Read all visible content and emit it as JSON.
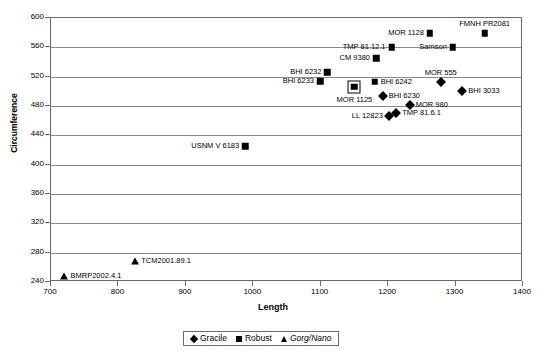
{
  "chart_data": {
    "type": "scatter",
    "title": "",
    "xlabel": "Length",
    "ylabel": "Circumference",
    "xlim": [
      700,
      1400
    ],
    "ylim": [
      240,
      600
    ],
    "xticks": [
      700,
      800,
      900,
      1000,
      1100,
      1200,
      1300,
      1400
    ],
    "yticks": [
      240,
      280,
      320,
      360,
      400,
      440,
      480,
      520,
      560,
      600
    ],
    "grid": "horizontal",
    "legend_position": "bottom-center",
    "series": [
      {
        "name": "Gracile",
        "marker": "diamond",
        "points": [
          {
            "label": "MOR 555",
            "x": 1278,
            "y": 513,
            "label_pos": "above"
          },
          {
            "label": "BHI 3033",
            "x": 1310,
            "y": 500,
            "label_pos": "right"
          },
          {
            "label": "BHI 6230",
            "x": 1192,
            "y": 493,
            "label_pos": "right"
          },
          {
            "label": "MOR 980",
            "x": 1232,
            "y": 481,
            "label_pos": "right"
          },
          {
            "label": "LL 12823",
            "x": 1201,
            "y": 467,
            "label_pos": "left"
          },
          {
            "label": "TMP 81.6.1",
            "x": 1212,
            "y": 470,
            "label_pos": "right"
          }
        ]
      },
      {
        "name": "Robust",
        "marker": "square",
        "points": [
          {
            "label": "FMNH PR2081",
            "x": 1343,
            "y": 579,
            "label_pos": "above"
          },
          {
            "label": "MOR 1128",
            "x": 1262,
            "y": 579,
            "label_pos": "left"
          },
          {
            "label": "Samson",
            "x": 1296,
            "y": 560,
            "label_pos": "left"
          },
          {
            "label": "TMP 81.12.1",
            "x": 1205,
            "y": 560,
            "label_pos": "left"
          },
          {
            "label": "CM 9380",
            "x": 1182,
            "y": 545,
            "label_pos": "left"
          },
          {
            "label": "BHI 6232",
            "x": 1110,
            "y": 526,
            "label_pos": "left"
          },
          {
            "label": "BHI 6233",
            "x": 1099,
            "y": 514,
            "label_pos": "left"
          },
          {
            "label": "BHI 6242",
            "x": 1180,
            "y": 513,
            "label_pos": "right"
          },
          {
            "label": "MOR 1125",
            "x": 1150,
            "y": 506,
            "label_pos": "below",
            "selected": true
          },
          {
            "label": "USNM V 6183",
            "x": 988,
            "y": 425,
            "label_pos": "left"
          }
        ]
      },
      {
        "name": "Gorg/Nano",
        "marker": "triangle",
        "italic": true,
        "points": [
          {
            "label": "TCM2001.89.1",
            "x": 825,
            "y": 269,
            "label_pos": "right"
          },
          {
            "label": "BMRP2002.4.1",
            "x": 720,
            "y": 248,
            "label_pos": "right"
          }
        ]
      }
    ]
  },
  "legend": {
    "items": [
      {
        "label": "Gracile",
        "marker": "diamond-marker",
        "italic": false
      },
      {
        "label": "Robust",
        "marker": "square-marker",
        "italic": false
      },
      {
        "label": "Gorg/Nano",
        "marker": "triangle-marker",
        "italic": true
      }
    ]
  },
  "axes": {
    "x_title": "Length",
    "y_title": "Circumference"
  }
}
